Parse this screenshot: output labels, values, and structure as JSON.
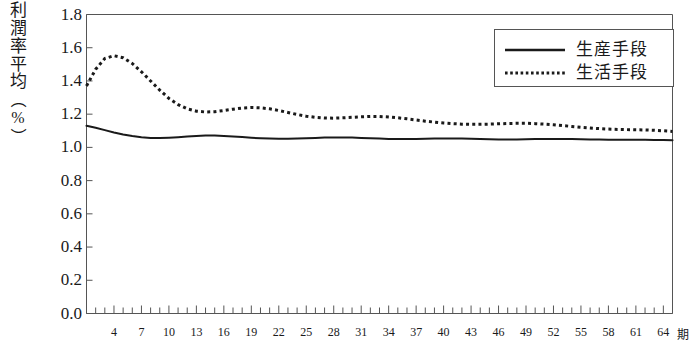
{
  "chart_data": {
    "type": "line",
    "title": "",
    "ylabel_chars": [
      "利",
      "潤",
      "率",
      "平",
      "均"
    ],
    "ylabel_unit_open": "（",
    "ylabel_unit": "%",
    "ylabel_unit_close": "）",
    "ylabel_full": "利潤率平均（%）",
    "xlabel": "",
    "x_unit_label": "期",
    "ylim": [
      0.0,
      1.8
    ],
    "yticks": [
      0.0,
      0.2,
      0.4,
      0.6,
      0.8,
      1.0,
      1.2,
      1.4,
      1.6,
      1.8
    ],
    "ytick_labels": [
      "0.0",
      "0.2",
      "0.4",
      "0.6",
      "0.8",
      "1.0",
      "1.2",
      "1.4",
      "1.6",
      "1.8"
    ],
    "xlim": [
      1,
      65
    ],
    "xticks_major": [
      4,
      7,
      10,
      13,
      16,
      19,
      22,
      25,
      28,
      31,
      34,
      37,
      40,
      43,
      46,
      49,
      52,
      55,
      58,
      61,
      64
    ],
    "xtick_labels": [
      "4",
      "7",
      "10",
      "13",
      "16",
      "19",
      "22",
      "25",
      "28",
      "31",
      "34",
      "37",
      "40",
      "43",
      "46",
      "49",
      "52",
      "55",
      "58",
      "61",
      "64"
    ],
    "xtick_minor_step": 1,
    "grid": false,
    "legend_position": "top-right",
    "colors": {
      "series_1": "#1a1a1a",
      "series_2": "#1a1a1a",
      "axis": "#555555",
      "background": "#ffffff"
    },
    "x": [
      1,
      2,
      3,
      4,
      5,
      6,
      7,
      8,
      9,
      10,
      11,
      12,
      13,
      14,
      15,
      16,
      17,
      18,
      19,
      20,
      21,
      22,
      23,
      24,
      25,
      26,
      27,
      28,
      29,
      30,
      31,
      32,
      33,
      34,
      35,
      36,
      37,
      38,
      39,
      40,
      41,
      42,
      43,
      44,
      45,
      46,
      47,
      48,
      49,
      50,
      51,
      52,
      53,
      54,
      55,
      56,
      57,
      58,
      59,
      60,
      61,
      62,
      63,
      64,
      65
    ],
    "series": [
      {
        "name": "生産手段",
        "style": "solid",
        "values": [
          1.13,
          1.118,
          1.104,
          1.09,
          1.078,
          1.068,
          1.061,
          1.057,
          1.056,
          1.058,
          1.061,
          1.065,
          1.069,
          1.071,
          1.071,
          1.069,
          1.066,
          1.062,
          1.058,
          1.055,
          1.053,
          1.052,
          1.052,
          1.053,
          1.055,
          1.057,
          1.059,
          1.06,
          1.06,
          1.059,
          1.057,
          1.055,
          1.053,
          1.051,
          1.05,
          1.05,
          1.051,
          1.052,
          1.053,
          1.054,
          1.054,
          1.053,
          1.052,
          1.05,
          1.049,
          1.048,
          1.048,
          1.048,
          1.049,
          1.05,
          1.051,
          1.051,
          1.051,
          1.05,
          1.049,
          1.048,
          1.047,
          1.046,
          1.046,
          1.046,
          1.046,
          1.046,
          1.045,
          1.044,
          1.043
        ]
      },
      {
        "name": "生活手段",
        "style": "dotted",
        "values": [
          1.37,
          1.47,
          1.535,
          1.552,
          1.54,
          1.505,
          1.455,
          1.4,
          1.345,
          1.295,
          1.258,
          1.232,
          1.218,
          1.213,
          1.215,
          1.222,
          1.23,
          1.237,
          1.24,
          1.238,
          1.232,
          1.222,
          1.21,
          1.198,
          1.188,
          1.181,
          1.177,
          1.176,
          1.178,
          1.181,
          1.184,
          1.186,
          1.186,
          1.183,
          1.178,
          1.172,
          1.165,
          1.158,
          1.152,
          1.147,
          1.143,
          1.14,
          1.139,
          1.139,
          1.14,
          1.142,
          1.144,
          1.145,
          1.145,
          1.143,
          1.14,
          1.136,
          1.131,
          1.126,
          1.121,
          1.117,
          1.113,
          1.11,
          1.108,
          1.107,
          1.106,
          1.105,
          1.103,
          1.1,
          1.096
        ]
      }
    ],
    "legend": [
      {
        "label": "生産手段",
        "style": "solid"
      },
      {
        "label": "生活手段",
        "style": "dotted"
      }
    ]
  }
}
